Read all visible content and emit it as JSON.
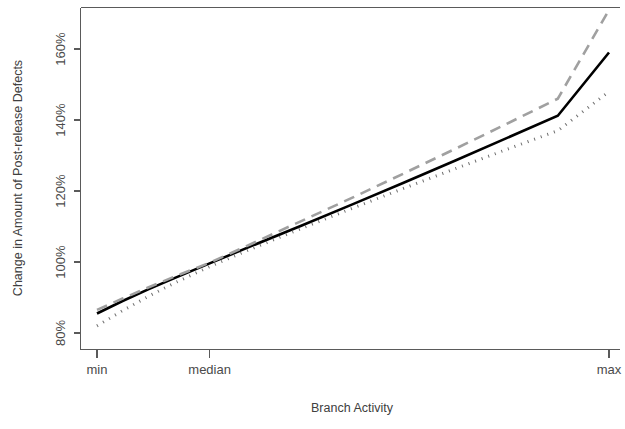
{
  "chart_data": {
    "type": "line",
    "title": "",
    "xlabel": "Branch Activity",
    "ylabel": "Change in Amount of Post-release Defects",
    "x_tick_labels": [
      "min",
      "median",
      "max"
    ],
    "x_tick_positions": [
      0.0,
      0.22,
      1.0
    ],
    "y_tick_labels": [
      "80%",
      "100%",
      "120%",
      "140%",
      "160%"
    ],
    "y_tick_values": [
      80,
      100,
      120,
      140,
      160
    ],
    "ylim": [
      75,
      175
    ],
    "xlim": [
      0,
      1
    ],
    "grid": false,
    "legend": "none",
    "box": true,
    "series": [
      {
        "name": "solid-black-line",
        "style": "solid",
        "color": "#000000",
        "width": 2.6,
        "x": [
          0.0,
          0.05,
          0.1,
          0.15,
          0.22,
          0.3,
          0.4,
          0.5,
          0.6,
          0.7,
          0.8,
          0.9,
          1.0
        ],
        "values": [
          85.5,
          89.0,
          92.3,
          95.4,
          99.6,
          104.4,
          110.3,
          116.3,
          122.4,
          128.6,
          134.9,
          141.2,
          159.0
        ],
        "values_note": "y at min=85.5%, at median=100%, at max=159%"
      },
      {
        "name": "dashed-gray-line",
        "style": "dashed",
        "color": "#a0a0a0",
        "width": 2.6,
        "dash": "11 7",
        "x": [
          0.0,
          0.05,
          0.1,
          0.15,
          0.22,
          0.3,
          0.4,
          0.5,
          0.6,
          0.7,
          0.8,
          0.9,
          1.0
        ],
        "values": [
          86.5,
          89.7,
          92.8,
          95.8,
          99.8,
          105.0,
          111.6,
          118.2,
          125.0,
          131.9,
          138.9,
          146.0,
          171.0
        ],
        "values_note": "y at min=86.5%, at median=100%, at max=171%"
      },
      {
        "name": "dotted-gray-line",
        "style": "dotted",
        "color": "#6e6e6e",
        "width": 3.0,
        "dash": "1 6",
        "x": [
          0.0,
          0.05,
          0.1,
          0.15,
          0.22,
          0.3,
          0.4,
          0.5,
          0.6,
          0.7,
          0.8,
          0.9,
          1.0
        ],
        "values": [
          82.0,
          86.3,
          90.3,
          94.0,
          98.7,
          103.6,
          109.5,
          115.2,
          120.8,
          126.3,
          131.7,
          137.0,
          148.0
        ],
        "values_note": "y at min=82%, at median≈99%, at max=148%"
      }
    ]
  },
  "axes": {
    "y_title": "Change in Amount of Post-release Defects",
    "x_title": "Branch Activity"
  }
}
